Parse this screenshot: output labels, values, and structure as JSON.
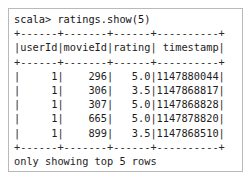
{
  "console": {
    "prompt_line": "scala> ratings.show(5)",
    "separator": "+------+-------+------+----------+",
    "header_line": "|userId|movieId|rating| timestamp|",
    "footer_line": "only showing top 5 rows",
    "row_lines": [
      "|     1|    296|   5.0|1147880044|",
      "|     1|    306|   3.5|1147868817|",
      "|     1|    307|   5.0|1147868828|",
      "|     1|    665|   5.0|1147878820|",
      "|     1|    899|   3.5|1147868510|"
    ],
    "command": "ratings.show(5)",
    "prompt_symbol": "scala>",
    "text_color": "#1d1d1d",
    "background_color": "#ffffff",
    "border_color": "#b9b9b9"
  },
  "table": {
    "columns": [
      "userId",
      "movieId",
      "rating",
      "timestamp"
    ],
    "rows": [
      [
        "1",
        "296",
        "5.0",
        "1147880044"
      ],
      [
        "1",
        "306",
        "3.5",
        "1147868817"
      ],
      [
        "1",
        "307",
        "5.0",
        "1147868828"
      ],
      [
        "1",
        "665",
        "5.0",
        "1147878820"
      ],
      [
        "1",
        "899",
        "3.5",
        "1147868510"
      ]
    ],
    "row_count_shown": 5,
    "truncation_note": "only showing top 5 rows"
  }
}
